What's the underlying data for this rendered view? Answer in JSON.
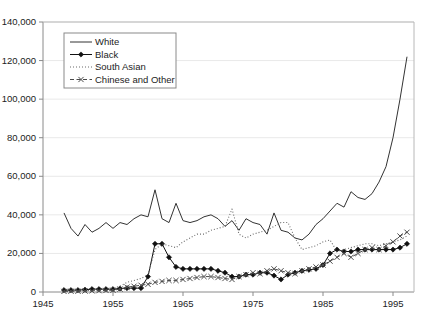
{
  "title": "",
  "chart_data": {
    "type": "line",
    "title": "",
    "xlabel": "",
    "ylabel": "",
    "xlim": [
      1945,
      1998
    ],
    "ylim": [
      0,
      140000
    ],
    "ytick_values": [
      0,
      20000,
      40000,
      60000,
      80000,
      100000,
      120000,
      140000
    ],
    "ytick_labels": [
      "0",
      "20,000",
      "40,000",
      "60,000",
      "80,000",
      "100,000",
      "120,000",
      "140,000"
    ],
    "xtick_values": [
      1945,
      1955,
      1965,
      1975,
      1985,
      1995
    ],
    "xtick_labels": [
      "1945",
      "1955",
      "1965",
      "1975",
      "1985",
      "1995"
    ],
    "grid": "horizontal",
    "legend_position": "top-left-inside",
    "x": [
      1948,
      1949,
      1950,
      1951,
      1952,
      1953,
      1954,
      1955,
      1956,
      1957,
      1958,
      1959,
      1960,
      1961,
      1962,
      1963,
      1964,
      1965,
      1966,
      1967,
      1968,
      1969,
      1970,
      1971,
      1972,
      1973,
      1974,
      1975,
      1976,
      1977,
      1978,
      1979,
      1980,
      1981,
      1982,
      1983,
      1984,
      1985,
      1986,
      1987,
      1988,
      1989,
      1990,
      1991,
      1992,
      1993,
      1994,
      1995,
      1996,
      1997
    ],
    "series": [
      {
        "name": "White",
        "style": "solid",
        "marker": "none",
        "color": "#333333",
        "values": [
          41000,
          33000,
          29000,
          35000,
          31000,
          33000,
          36000,
          33000,
          36000,
          35000,
          38000,
          40000,
          39000,
          53000,
          38000,
          36000,
          46000,
          37000,
          36000,
          37000,
          39000,
          40000,
          38000,
          34000,
          37000,
          32000,
          38000,
          36000,
          35000,
          30000,
          41000,
          32000,
          31000,
          28000,
          27000,
          30000,
          35000,
          38000,
          42000,
          46000,
          44000,
          52000,
          49000,
          48000,
          51000,
          57000,
          65000,
          80000,
          100000,
          122000
        ]
      },
      {
        "name": "Black",
        "style": "solid",
        "marker": "diamond",
        "color": "#111111",
        "values": [
          1000,
          1000,
          1000,
          1200,
          1500,
          1500,
          1500,
          1500,
          1800,
          2000,
          2000,
          2000,
          8000,
          25000,
          25000,
          18000,
          13000,
          12000,
          12000,
          12000,
          12000,
          12000,
          11000,
          10000,
          8000,
          8000,
          9000,
          9000,
          10000,
          10000,
          8500,
          6500,
          9000,
          10000,
          11000,
          11500,
          12000,
          14000,
          20000,
          22000,
          21000,
          21000,
          22000,
          22000,
          22000,
          22000,
          22000,
          22000,
          23000,
          25000
        ]
      },
      {
        "name": "South Asian",
        "style": "dotted",
        "marker": "none",
        "color": "#6b6b6b",
        "values": [
          500,
          500,
          600,
          700,
          800,
          900,
          1000,
          1200,
          3000,
          5000,
          6000,
          7000,
          9000,
          22000,
          25000,
          24000,
          23000,
          26000,
          28000,
          30000,
          30000,
          32000,
          33000,
          34000,
          43000,
          30000,
          28000,
          30000,
          31000,
          32000,
          34000,
          36000,
          36000,
          28000,
          22000,
          23000,
          24000,
          26000,
          27000,
          21000,
          22000,
          23000,
          24000,
          25000,
          25000,
          24000,
          25000,
          26000,
          27000,
          29000
        ]
      },
      {
        "name": "Chinese and Other",
        "style": "dashed",
        "marker": "cross",
        "color": "#4a4a4a",
        "values": [
          300,
          400,
          400,
          500,
          600,
          700,
          800,
          900,
          1500,
          2500,
          3000,
          3500,
          4000,
          5000,
          5500,
          6000,
          6000,
          6500,
          7000,
          7500,
          8000,
          8000,
          7500,
          7000,
          6500,
          8000,
          9000,
          10000,
          9500,
          11000,
          12000,
          11000,
          10000,
          9500,
          11000,
          12000,
          13000,
          14000,
          16000,
          18000,
          20000,
          18000,
          20000,
          22000,
          23000,
          22000,
          24000,
          26000,
          29000,
          31000
        ]
      }
    ]
  },
  "legend": {
    "items": [
      {
        "label": "White"
      },
      {
        "label": "Black"
      },
      {
        "label": "South Asian"
      },
      {
        "label": "Chinese and Other"
      }
    ]
  }
}
